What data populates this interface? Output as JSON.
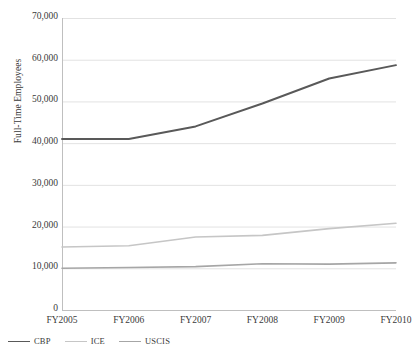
{
  "chart_data": {
    "type": "line",
    "title": "",
    "xlabel": "",
    "ylabel": "Full-Time Employees",
    "categories": [
      "FY2005",
      "FY2006",
      "FY2007",
      "FY2008",
      "FY2009",
      "FY2010"
    ],
    "ylim": [
      0,
      70000
    ],
    "ytick_values": [
      0,
      10000,
      20000,
      30000,
      40000,
      50000,
      60000,
      70000
    ],
    "ytick_labels": [
      "0",
      "10,000",
      "20,000",
      "30,000",
      "40,000",
      "50,000",
      "60,000",
      "70,000"
    ],
    "grid": true,
    "grid_axis": "y",
    "legend_position": "bottom-left",
    "series": [
      {
        "name": "CBP",
        "color": "#595959",
        "width": 1.9,
        "values": [
          41000,
          41000,
          44000,
          49500,
          55500,
          58700
        ]
      },
      {
        "name": "ICE",
        "color": "#c6c6c6",
        "width": 1.6,
        "values": [
          15100,
          15400,
          17500,
          17900,
          19500,
          20800
        ]
      },
      {
        "name": "USCIS",
        "color": "#a6a6a6",
        "width": 1.6,
        "values": [
          10000,
          10200,
          10400,
          11100,
          11000,
          11300
        ]
      }
    ]
  },
  "style": {
    "axis_color": "#bfbfbf",
    "grid_color": "#e2e2e2",
    "text_color": "#3a3a3a",
    "background": "#ffffff"
  }
}
